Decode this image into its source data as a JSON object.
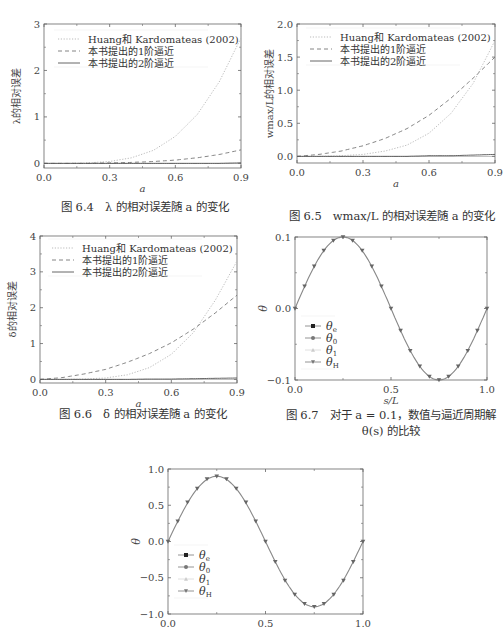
{
  "page": {
    "top_text_fragment": "……"
  },
  "figures": [
    {
      "id": "fig-6-4",
      "caption_num": "图 6.4",
      "caption_text": "λ 的相对误差随 a 的变化",
      "ylabel": "λ的相对误差",
      "xlabel": "a",
      "yticks": [
        "0",
        "1",
        "2",
        "3"
      ],
      "xticks": [
        "0.0",
        "0.3",
        "0.6",
        "0.9"
      ],
      "legend": [
        "Huang和 Kardomateas (2002)",
        "本书提出的1阶逼近",
        "本书提出的2阶逼近"
      ]
    },
    {
      "id": "fig-6-5",
      "caption_num": "图 6.5",
      "caption_text": "wmax/L 的相对误差随 a 的变化",
      "ylabel": "wmax/L的相对误差",
      "xlabel": "a",
      "yticks": [
        "0.0",
        "0.5",
        "1.0",
        "1.5",
        "2.0"
      ],
      "xticks": [
        "0.0",
        "0.3",
        "0.6",
        "0.9"
      ],
      "legend": [
        "Huang和 Kardomateas (2002)",
        "本书提出的1阶逼近",
        "本书提出的2阶逼近"
      ]
    },
    {
      "id": "fig-6-6",
      "caption_num": "图 6.6",
      "caption_text": "δ 的相对误差随 a 的变化",
      "ylabel": "δ的相对误差",
      "xlabel": "a",
      "yticks": [
        "0",
        "1",
        "2",
        "3",
        "4"
      ],
      "xticks": [
        "0.0",
        "0.3",
        "0.6",
        "0.9"
      ],
      "legend": [
        "Huang和 Kardomateas (2002)",
        "本书提出的1阶逼近",
        "本书提出的2阶逼近"
      ]
    },
    {
      "id": "fig-6-7",
      "caption_num": "图 6.7",
      "caption_text": "对于 a = 0.1，数值与逼近周期解",
      "caption_line2": "θ(s) 的比较",
      "ylabel": "θ",
      "xlabel": "s/L",
      "yticks": [
        "−0.1",
        "0.0",
        "0.1"
      ],
      "xticks": [
        "0.0",
        "0.5",
        "1.0"
      ],
      "legend": [
        "θe",
        "θ0",
        "θ1",
        "θH"
      ]
    },
    {
      "id": "fig-6-8-partial",
      "ylabel": "θ",
      "yticks": [
        "−1.0",
        "−0.5",
        "0.0",
        "0.5",
        "1.0"
      ],
      "xticks": [
        "0.0",
        "0.5",
        "1.0"
      ],
      "legend": [
        "θe",
        "θ0",
        "θ1",
        "θH"
      ]
    }
  ],
  "chart_data": [
    {
      "type": "line",
      "title": "图 6.4 λ 的相对误差随 a 的变化",
      "xlabel": "a",
      "ylabel": "λ的相对误差",
      "xlim": [
        0,
        0.9
      ],
      "ylim": [
        -0.1,
        3
      ],
      "x": [
        0.0,
        0.1,
        0.2,
        0.3,
        0.4,
        0.5,
        0.6,
        0.7,
        0.8,
        0.9
      ],
      "series": [
        {
          "name": "Huang和 Kardomateas (2002)",
          "style": "dotted",
          "values": [
            0.0,
            0.0,
            0.01,
            0.04,
            0.12,
            0.28,
            0.58,
            1.05,
            1.75,
            2.7
          ]
        },
        {
          "name": "本书提出的1阶逼近",
          "style": "dashed",
          "values": [
            0.0,
            0.0,
            0.0,
            0.01,
            0.02,
            0.04,
            0.07,
            0.12,
            0.19,
            0.29
          ]
        },
        {
          "name": "本书提出的2阶逼近",
          "style": "solid",
          "values": [
            0.0,
            0.0,
            0.0,
            0.0,
            0.0,
            0.0,
            0.0,
            0.0,
            0.0,
            0.01
          ]
        }
      ],
      "legend_position": "upper left"
    },
    {
      "type": "line",
      "title": "图 6.5 wmax/L 的相对误差随 a 的变化",
      "xlabel": "a",
      "ylabel": "wmax/L的相对误差",
      "xlim": [
        0,
        0.9
      ],
      "ylim": [
        -0.1,
        2.0
      ],
      "x": [
        0.0,
        0.1,
        0.2,
        0.3,
        0.4,
        0.5,
        0.6,
        0.7,
        0.8,
        0.9
      ],
      "series": [
        {
          "name": "Huang和 Kardomateas (2002)",
          "style": "dotted",
          "values": [
            0.0,
            0.0,
            0.01,
            0.03,
            0.08,
            0.17,
            0.35,
            0.65,
            1.1,
            1.75
          ]
        },
        {
          "name": "本书提出的1阶逼近",
          "style": "dashed",
          "values": [
            0.0,
            0.03,
            0.08,
            0.16,
            0.27,
            0.42,
            0.62,
            0.88,
            1.18,
            1.5
          ]
        },
        {
          "name": "本书提出的2阶逼近",
          "style": "solid",
          "values": [
            0.0,
            0.0,
            0.0,
            0.0,
            0.0,
            0.0,
            0.01,
            0.01,
            0.02,
            0.03
          ]
        }
      ],
      "legend_position": "upper left"
    },
    {
      "type": "line",
      "title": "图 6.6 δ 的相对误差随 a 的变化",
      "xlabel": "a",
      "ylabel": "δ的相对误差",
      "xlim": [
        0,
        0.9
      ],
      "ylim": [
        -0.1,
        4
      ],
      "x": [
        0.0,
        0.1,
        0.2,
        0.3,
        0.4,
        0.5,
        0.6,
        0.7,
        0.8,
        0.9
      ],
      "series": [
        {
          "name": "Huang和 Kardomateas (2002)",
          "style": "dotted",
          "values": [
            0.0,
            0.0,
            0.01,
            0.04,
            0.13,
            0.33,
            0.7,
            1.3,
            2.2,
            3.3
          ]
        },
        {
          "name": "本书提出的1阶逼近",
          "style": "dashed",
          "values": [
            0.0,
            0.05,
            0.15,
            0.28,
            0.48,
            0.72,
            1.02,
            1.4,
            1.85,
            2.35
          ]
        },
        {
          "name": "本书提出的2阶逼近",
          "style": "solid",
          "values": [
            0.0,
            0.0,
            0.0,
            0.0,
            0.0,
            0.01,
            0.01,
            0.02,
            0.03,
            0.04
          ]
        }
      ],
      "legend_position": "upper left"
    },
    {
      "type": "line",
      "title": "图 6.7 对于 a = 0.1，数值与逼近周期解 θ(s) 的比较",
      "xlabel": "s/L",
      "ylabel": "θ",
      "xlim": [
        0,
        1.0
      ],
      "ylim": [
        -0.1,
        0.1
      ],
      "x": [
        0.0,
        0.05,
        0.1,
        0.15,
        0.2,
        0.25,
        0.3,
        0.35,
        0.4,
        0.45,
        0.5,
        0.55,
        0.6,
        0.65,
        0.7,
        0.75,
        0.8,
        0.85,
        0.9,
        0.95,
        1.0
      ],
      "series": [
        {
          "name": "θe",
          "marker": "square",
          "values": [
            0.0,
            0.031,
            0.059,
            0.081,
            0.095,
            0.1,
            0.095,
            0.081,
            0.059,
            0.031,
            0.0,
            -0.031,
            -0.059,
            -0.081,
            -0.095,
            -0.1,
            -0.095,
            -0.081,
            -0.059,
            -0.031,
            0.0
          ]
        },
        {
          "name": "θ0",
          "marker": "circle",
          "values": [
            0.0,
            0.031,
            0.059,
            0.081,
            0.095,
            0.1,
            0.095,
            0.081,
            0.059,
            0.031,
            0.0,
            -0.031,
            -0.059,
            -0.081,
            -0.095,
            -0.1,
            -0.095,
            -0.081,
            -0.059,
            -0.031,
            0.0
          ]
        },
        {
          "name": "θ1",
          "marker": "triangle-up",
          "values": [
            0.0,
            0.031,
            0.059,
            0.081,
            0.095,
            0.1,
            0.095,
            0.081,
            0.059,
            0.031,
            0.0,
            -0.031,
            -0.059,
            -0.081,
            -0.095,
            -0.1,
            -0.095,
            -0.081,
            -0.059,
            -0.031,
            0.0
          ]
        },
        {
          "name": "θH",
          "marker": "triangle-down",
          "values": [
            0.0,
            0.031,
            0.059,
            0.081,
            0.095,
            0.1,
            0.095,
            0.081,
            0.059,
            0.031,
            0.0,
            -0.031,
            -0.059,
            -0.081,
            -0.095,
            -0.1,
            -0.095,
            -0.081,
            -0.059,
            -0.031,
            0.0
          ]
        }
      ],
      "legend_position": "lower left"
    },
    {
      "type": "line",
      "title": "",
      "xlabel": "",
      "ylabel": "θ",
      "xlim": [
        0,
        1.0
      ],
      "ylim": [
        -1.0,
        1.0
      ],
      "x": [
        0.0,
        0.05,
        0.1,
        0.15,
        0.2,
        0.25,
        0.3,
        0.35,
        0.4,
        0.45,
        0.5,
        0.55,
        0.6,
        0.65,
        0.7,
        0.75,
        0.8,
        0.85,
        0.9,
        0.95,
        1.0
      ],
      "series": [
        {
          "name": "θe",
          "marker": "square",
          "values": [
            0.0,
            0.28,
            0.54,
            0.73,
            0.86,
            0.9,
            0.86,
            0.73,
            0.54,
            0.28,
            0.0,
            -0.28,
            -0.54,
            -0.73,
            -0.86,
            -0.9,
            -0.86,
            -0.73,
            -0.54,
            -0.28,
            0.0
          ]
        },
        {
          "name": "θ0",
          "marker": "circle",
          "values": [
            0.0,
            0.28,
            0.54,
            0.73,
            0.86,
            0.9,
            0.86,
            0.73,
            0.54,
            0.28,
            0.0,
            -0.28,
            -0.54,
            -0.73,
            -0.86,
            -0.9,
            -0.86,
            -0.73,
            -0.54,
            -0.28,
            0.0
          ]
        },
        {
          "name": "θ1",
          "marker": "triangle-up",
          "values": [
            0.0,
            0.28,
            0.54,
            0.73,
            0.86,
            0.9,
            0.86,
            0.73,
            0.54,
            0.28,
            0.0,
            -0.28,
            -0.54,
            -0.73,
            -0.86,
            -0.9,
            -0.86,
            -0.73,
            -0.54,
            -0.28,
            0.0
          ]
        },
        {
          "name": "θH",
          "marker": "triangle-down",
          "values": [
            0.0,
            0.28,
            0.54,
            0.73,
            0.86,
            0.9,
            0.86,
            0.73,
            0.54,
            0.28,
            0.0,
            -0.28,
            -0.54,
            -0.73,
            -0.86,
            -0.9,
            -0.86,
            -0.73,
            -0.54,
            -0.28,
            0.0
          ]
        }
      ],
      "legend_position": "lower left"
    }
  ]
}
